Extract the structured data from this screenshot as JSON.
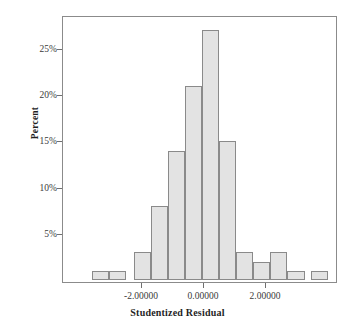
{
  "chart_data": {
    "type": "bar",
    "title": "",
    "xlabel": "Studentized Residual",
    "ylabel": "Percent",
    "grid": false,
    "legend": null,
    "xlim": [
      -3.5,
      3.5
    ],
    "ylim": [
      0,
      28
    ],
    "xtick_labels": [
      "-2.00000",
      "0.00000",
      "2.00000"
    ],
    "xtick_values": [
      -2,
      0,
      2
    ],
    "ytick_labels": [
      "5%",
      "10%",
      "15%",
      "20%",
      "25%"
    ],
    "ytick_values": [
      5,
      10,
      15,
      20,
      25
    ],
    "bin_width": 0.55,
    "bar_fill_color": "#e3e3e3",
    "bar_edge_color": "#8a8a8a",
    "categories": [
      -3.3,
      -2.75,
      -2.2,
      -1.65,
      -1.1,
      -0.55,
      0.0,
      0.55,
      1.1,
      1.65,
      2.2,
      2.75,
      3.3
    ],
    "bars": [
      {
        "center": -3.3,
        "value": 1
      },
      {
        "center": -2.75,
        "value": 1
      },
      {
        "center": -1.95,
        "value": 3
      },
      {
        "center": -1.4,
        "value": 8
      },
      {
        "center": -0.85,
        "value": 14
      },
      {
        "center": -0.3,
        "value": 21
      },
      {
        "center": 0.25,
        "value": 27
      },
      {
        "center": 0.8,
        "value": 15
      },
      {
        "center": 1.35,
        "value": 3
      },
      {
        "center": 1.9,
        "value": 2
      },
      {
        "center": 2.45,
        "value": 3
      },
      {
        "center": 3.0,
        "value": 1
      },
      {
        "center": 3.75,
        "value": 1
      }
    ],
    "values": [
      1,
      1,
      3,
      8,
      14,
      21,
      27,
      15,
      3,
      2,
      3,
      1,
      1
    ]
  }
}
